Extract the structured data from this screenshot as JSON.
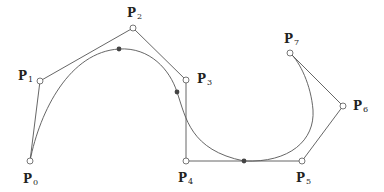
{
  "diagram": {
    "type": "bezier-spline",
    "colors": {
      "stroke": "#555555",
      "text": "#222222",
      "dot": "#444444"
    },
    "control_points": [
      {
        "id": "P0",
        "letter": "P",
        "index": "0",
        "x": 30,
        "y": 161
      },
      {
        "id": "P1",
        "letter": "P",
        "index": "1",
        "x": 40,
        "y": 81
      },
      {
        "id": "P2",
        "letter": "P",
        "index": "2",
        "x": 133,
        "y": 28
      },
      {
        "id": "P3",
        "letter": "P",
        "index": "3",
        "x": 186,
        "y": 80
      },
      {
        "id": "P4",
        "letter": "P",
        "index": "4",
        "x": 186,
        "y": 161
      },
      {
        "id": "P5",
        "letter": "P",
        "index": "5",
        "x": 302,
        "y": 161
      },
      {
        "id": "P6",
        "letter": "P",
        "index": "6",
        "x": 343,
        "y": 106
      },
      {
        "id": "P7",
        "letter": "P",
        "index": "7",
        "x": 290,
        "y": 53
      }
    ],
    "curve_points": [
      {
        "x": 119,
        "y": 49
      },
      {
        "x": 177,
        "y": 92
      },
      {
        "x": 244,
        "y": 161
      }
    ]
  }
}
